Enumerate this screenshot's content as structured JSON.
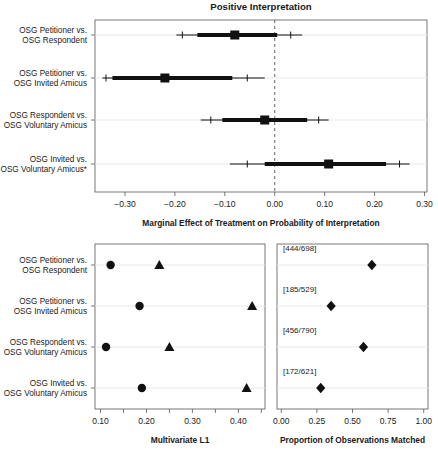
{
  "figure": {
    "title": "Positive Interpretation",
    "row_labels": [
      [
        "OSG Petitioner vs.",
        "OSG Respondent"
      ],
      [
        "OSG Petitioner vs.",
        "OSG Invited Amicus"
      ],
      [
        "OSG Respondent vs.",
        "OSG Voluntary Amicus"
      ],
      [
        "OSG Invited vs.",
        "OSG Voluntary Amicus*"
      ]
    ],
    "row_labels_bottom": [
      [
        "OSG Petitioner vs.",
        "OSG Respondent"
      ],
      [
        "OSG Petitioner vs.",
        "OSG Invited Amicus"
      ],
      [
        "OSG Respondent vs.",
        "OSG Voluntary Amicus"
      ],
      [
        "OSG Invited vs.",
        "OSG Voluntary Amicus"
      ]
    ],
    "marker_color": "#111111",
    "gridline_color": "#e8e8e8",
    "axis_color": "#555555",
    "reference_line_value": 0.0
  },
  "chart_data": [
    {
      "type": "scatter",
      "panel": "top",
      "title": "Positive Interpretation",
      "xlabel": "Marginal Effect of Treatment on Probability of Interpretation",
      "ylabel": "",
      "xlim": [
        -0.36,
        0.305
      ],
      "xticks": [
        -0.3,
        -0.2,
        -0.1,
        0.0,
        0.1,
        0.2,
        0.3
      ],
      "xticklabels": [
        "-0.30",
        "-0.20",
        "-0.10",
        "0.00",
        "0.10",
        "0.20",
        "0.30"
      ],
      "grid": true,
      "reference_line": 0.0,
      "categories": [
        "OSG Petitioner vs. OSG Respondent",
        "OSG Petitioner vs. OSG Invited Amicus",
        "OSG Respondent vs. OSG Voluntary Amicus",
        "OSG Invited vs. OSG Voluntary Amicus*"
      ],
      "estimates": [
        -0.08,
        -0.22,
        -0.02,
        0.108
      ],
      "inner_ci_low": [
        -0.155,
        -0.325,
        -0.105,
        -0.02
      ],
      "inner_ci_high": [
        0.005,
        -0.085,
        0.065,
        0.223
      ],
      "outer_ci_low": [
        -0.197,
        -0.345,
        -0.148,
        -0.09
      ],
      "outer_ci_high": [
        0.055,
        -0.02,
        0.108,
        0.27
      ],
      "tick_low": [
        -0.185,
        -0.338,
        -0.128,
        -0.055
      ],
      "tick_high": [
        0.032,
        -0.055,
        0.088,
        0.25
      ]
    },
    {
      "type": "scatter",
      "panel": "bottom-left",
      "title": "",
      "xlabel": "Multivariate L1",
      "xlim": [
        0.088,
        0.458
      ],
      "xticks": [
        0.1,
        0.15,
        0.2,
        0.25,
        0.3,
        0.35,
        0.4,
        0.45
      ],
      "xticklabels_major": [
        "0.10",
        "0.20",
        "0.30",
        "0.40"
      ],
      "xticks_major": [
        0.1,
        0.2,
        0.3,
        0.4
      ],
      "grid": true,
      "categories": [
        "OSG Petitioner vs. OSG Respondent",
        "OSG Petitioner vs. OSG Invited Amicus",
        "OSG Respondent vs. OSG Voluntary Amicus",
        "OSG Invited vs. OSG Voluntary Amicus"
      ],
      "series": [
        {
          "name": "circle",
          "marker": "circle",
          "values": [
            0.122,
            0.185,
            0.112,
            0.19
          ]
        },
        {
          "name": "triangle",
          "marker": "triangle",
          "values": [
            0.228,
            0.43,
            0.25,
            0.418
          ]
        }
      ]
    },
    {
      "type": "scatter",
      "panel": "bottom-right",
      "title": "",
      "xlabel": "Proportion of Observations Matched",
      "xlim": [
        -0.03,
        1.03
      ],
      "xticks": [
        0.0,
        0.25,
        0.5,
        0.75,
        1.0
      ],
      "xticklabels": [
        "0.00",
        "0.25",
        "0.50",
        "0.75",
        "1.00"
      ],
      "grid": true,
      "categories": [
        "OSG Petitioner vs. OSG Respondent",
        "OSG Petitioner vs. OSG Invited Amicus",
        "OSG Respondent vs. OSG Voluntary Amicus",
        "OSG Invited vs. OSG Voluntary Amicus"
      ],
      "values": [
        0.636,
        0.35,
        0.577,
        0.277
      ],
      "annotations": [
        "[444/698]",
        "[185/529]",
        "[456/790]",
        "[172/621]"
      ]
    }
  ]
}
